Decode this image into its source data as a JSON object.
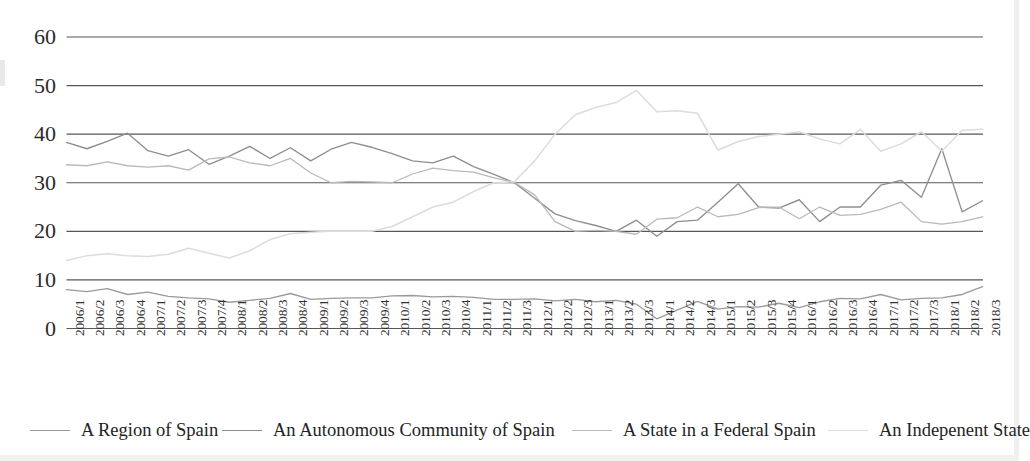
{
  "chart_data": {
    "type": "line",
    "title": "",
    "subtitle": "",
    "xlabel": "",
    "ylabel": "",
    "ylim": [
      0,
      60
    ],
    "y_ticks": [
      0,
      10,
      20,
      30,
      40,
      50,
      60
    ],
    "grid": "horizontal",
    "legend_position": "bottom",
    "categories": [
      "2006/1",
      "2006/2",
      "2006/3",
      "2006/4",
      "2007/1",
      "2007/2",
      "2007/3",
      "2007/4",
      "2008/1",
      "2008/2",
      "2008/3",
      "2008/4",
      "2009/1",
      "2009/2",
      "2009/3",
      "2009/4",
      "2010/1",
      "2010/2",
      "2010/3",
      "2010/4",
      "2011/1",
      "2011/2",
      "2011/3",
      "2012/1",
      "2012/2",
      "2012/3",
      "2013/1",
      "2013/2",
      "2013/3",
      "2014/1",
      "2014/2",
      "2014/3",
      "2015/1",
      "2015/2",
      "2015/3",
      "2015/4",
      "2016/1",
      "2016/2",
      "2016/3",
      "2016/4",
      "2017/1",
      "2017/2",
      "2017/3",
      "2018/1",
      "2018/2",
      "2018/3"
    ],
    "series": [
      {
        "name": "A Region of Spain",
        "color": "#9a9a9a",
        "values": [
          8.0,
          7.6,
          8.2,
          7.0,
          7.5,
          6.6,
          6.3,
          6.1,
          5.4,
          5.8,
          6.2,
          7.2,
          6.0,
          6.2,
          6.3,
          6.3,
          6.7,
          6.8,
          6.5,
          6.6,
          6.4,
          6.0,
          6.0,
          6.1,
          5.7,
          6.0,
          5.5,
          5.8,
          5.0,
          2.0,
          3.8,
          5.6,
          4.0,
          4.5,
          4.4,
          5.2,
          4.3,
          5.5,
          6.2,
          6.1,
          7.0,
          5.9,
          6.2,
          6.3,
          7.0,
          8.6
        ]
      },
      {
        "name": "An Autonomous Community of Spain",
        "color": "#8e8e8e",
        "values": [
          38.3,
          37.0,
          38.5,
          40.2,
          36.6,
          35.5,
          36.8,
          33.8,
          35.5,
          37.5,
          35.0,
          37.2,
          34.5,
          36.9,
          38.3,
          37.3,
          36.0,
          34.5,
          34.1,
          35.5,
          33.3,
          31.7,
          30.0,
          26.8,
          23.6,
          22.2,
          21.2,
          20.0,
          22.3,
          19.0,
          22.0,
          22.3,
          26.0,
          29.8,
          25.0,
          24.8,
          26.5,
          22.0,
          25.0,
          25.0,
          29.5,
          30.5,
          27.0,
          37.0,
          24.0,
          26.3
        ]
      },
      {
        "name": "A State in a Federal Spain",
        "color": "#b9b9b9",
        "values": [
          33.7,
          33.5,
          34.3,
          33.5,
          33.2,
          33.5,
          32.6,
          34.9,
          35.3,
          34.1,
          33.5,
          35.0,
          32.0,
          30.0,
          30.3,
          30.2,
          30.0,
          31.8,
          33.0,
          32.5,
          32.2,
          31.0,
          30.1,
          27.5,
          22.0,
          20.0,
          20.2,
          20.0,
          19.4,
          22.5,
          22.8,
          25.0,
          23.0,
          23.5,
          24.9,
          25.0,
          22.6,
          25.0,
          23.3,
          23.5,
          24.5,
          26.0,
          22.0,
          21.5,
          22.0,
          23.0
        ]
      },
      {
        "name": "An Indepenent State",
        "color": "#dcdcdc",
        "values": [
          14.0,
          15.0,
          15.4,
          15.0,
          14.8,
          15.3,
          16.5,
          15.5,
          14.5,
          16.0,
          18.3,
          19.5,
          19.8,
          20.0,
          20.0,
          20.0,
          21.0,
          23.0,
          25.0,
          26.0,
          28.2,
          30.0,
          30.2,
          34.5,
          40.0,
          44.0,
          45.5,
          46.5,
          49.0,
          44.6,
          44.8,
          44.3,
          36.7,
          38.5,
          39.5,
          40.0,
          40.5,
          39.0,
          38.0,
          41.0,
          36.5,
          38.0,
          40.5,
          36.5,
          40.8,
          41.0
        ]
      }
    ]
  },
  "legend": {
    "items": [
      {
        "label": "A Region of Spain",
        "color": "#9a9a9a"
      },
      {
        "label": "An Autonomous Community of Spain",
        "color": "#8e8e8e"
      },
      {
        "label": "A State in a Federal Spain",
        "color": "#b9b9b9"
      },
      {
        "label": "An Indepenent State",
        "color": "#dcdcdc"
      }
    ]
  },
  "axes": {
    "y_tick_labels": [
      "60",
      "50",
      "40",
      "30",
      "20",
      "10",
      "0"
    ]
  }
}
